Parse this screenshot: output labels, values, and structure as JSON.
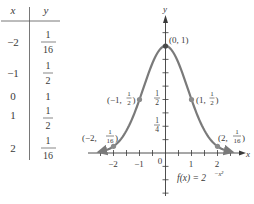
{
  "table": {
    "headers": [
      "x",
      "y"
    ],
    "rows": [
      {
        "x": "−2",
        "y_num": "1",
        "y_den": "16"
      },
      {
        "x": "−1",
        "y_num": "1",
        "y_den": "2"
      },
      {
        "x": "0",
        "y": "1"
      },
      {
        "x": "1",
        "y_num": "1",
        "y_den": "2"
      },
      {
        "x": "2",
        "y_num": "1",
        "y_den": "16"
      }
    ]
  },
  "colors": {
    "curve": "#7a7a7a",
    "axis": "#3a3a3a",
    "text": "#3a3a3a"
  },
  "chart_data": {
    "type": "line",
    "title": "",
    "function_label": "f(x) = 2^(−x²)",
    "xlabel": "x",
    "ylabel": "y",
    "x_ticks": [
      -2,
      -1,
      0,
      1,
      2
    ],
    "x_tick_labels": [
      "−2",
      "−1",
      "0",
      "1",
      "2"
    ],
    "y_tick_labels": [
      {
        "value": 0.5,
        "label": "1/2"
      },
      {
        "value": 0.25,
        "label": "1/4"
      }
    ],
    "xlim": [
      -2.9,
      2.9
    ],
    "ylim": [
      -0.6,
      1.35
    ],
    "grid": false,
    "series": [
      {
        "name": "f(x) = 2^(−x²)",
        "x": [
          -2,
          -1,
          0,
          1,
          2
        ],
        "values": [
          0.0625,
          0.5,
          1,
          0.5,
          0.0625
        ]
      }
    ],
    "annotations": [
      {
        "point": [
          0,
          1
        ],
        "label": "(0, 1)"
      },
      {
        "point": [
          -1,
          0.5
        ],
        "label": "(−1, 1/2)"
      },
      {
        "point": [
          1,
          0.5
        ],
        "label": "(1, 1/2)"
      },
      {
        "point": [
          -2,
          0.0625
        ],
        "label": "(−2, 1/16)"
      },
      {
        "point": [
          2,
          0.0625
        ],
        "label": "(2, 1/16)"
      }
    ]
  }
}
